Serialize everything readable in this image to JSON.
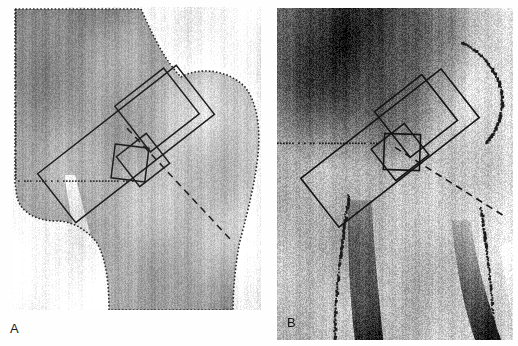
{
  "figure": {
    "kind": "radiograph-figure",
    "background_color": "#ffffff",
    "width": 518,
    "height": 346,
    "caption_text": "",
    "panels": [
      {
        "id": "A",
        "label": "A",
        "label_position": "below-left-outside",
        "label_x": 10,
        "label_y": 322,
        "modality_text": "",
        "frame": {
          "x": 13,
          "y": 7,
          "w": 248,
          "h": 303
        },
        "description_text": "",
        "appearance": {
          "segmented": true,
          "background_color": "#ffffff",
          "bone_base_color": "#9a9a9a",
          "bone_light_color": "#c9c9c9",
          "bone_dark_color": "#6d6d6d",
          "contour_color": "#2b2b2b",
          "roi_line_color": "#1e1e1e",
          "contrast_label": "low",
          "noise_amount": 0.55
        },
        "rois": [
          {
            "name": "femoral-neck-box",
            "cx": 126,
            "cy": 144,
            "w": 176,
            "h": 62,
            "angle": -38
          },
          {
            "name": "upper-neck-box",
            "cx": 157,
            "cy": 110,
            "w": 62,
            "h": 58,
            "angle": -38
          },
          {
            "name": "ward-triangle-box",
            "cx": 143,
            "cy": 160,
            "w": 38,
            "h": 38,
            "angle": -38
          },
          {
            "name": "ward-inner-box",
            "cx": 130,
            "cy": 163,
            "w": 34,
            "h": 34,
            "angle": 7
          }
        ],
        "fracture_line": {
          "name": "subcapital-lucency",
          "x1": 65,
          "y1": 175,
          "x2": 90,
          "y2": 275
        }
      },
      {
        "id": "B",
        "label": "B",
        "label_position": "inside-bottom-left",
        "label_x": 287,
        "label_y": 316,
        "modality_text": "",
        "frame": {
          "x": 277,
          "y": 8,
          "w": 236,
          "h": 332
        },
        "description_text": "",
        "appearance": {
          "segmented": false,
          "background_color": "#a8a8a8",
          "bone_base_color": "#a0a0a0",
          "bone_light_color": "#d8d8d8",
          "bone_dark_color": "#2a2a2a",
          "contour_color": "#1a1a1a",
          "roi_line_color": "#141414",
          "contrast_label": "high",
          "noise_amount": 0.85
        },
        "rois": [
          {
            "name": "femoral-neck-box",
            "cx": 390,
            "cy": 148,
            "w": 178,
            "h": 62,
            "angle": -38
          },
          {
            "name": "upper-neck-box",
            "cx": 416,
            "cy": 116,
            "w": 60,
            "h": 58,
            "angle": -38
          },
          {
            "name": "ward-triangle-box",
            "cx": 400,
            "cy": 152,
            "w": 42,
            "h": 40,
            "angle": -38
          },
          {
            "name": "ward-inner-box",
            "cx": 402,
            "cy": 152,
            "w": 36,
            "h": 36,
            "angle": 2
          }
        ],
        "fracture_line": {
          "name": "dark-band",
          "x1": 345,
          "y1": 60,
          "x2": 360,
          "y2": 300
        }
      }
    ]
  }
}
